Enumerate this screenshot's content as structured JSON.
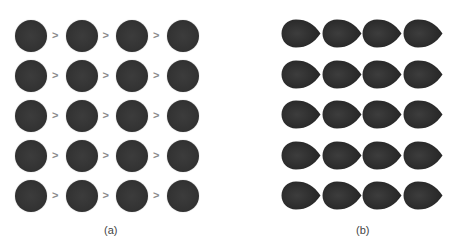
{
  "panels": [
    {
      "id": "a",
      "label": "(a)",
      "shape": "circle",
      "rows": 5,
      "cols": 4,
      "separator": ">",
      "fill_color": "#333333"
    },
    {
      "id": "b",
      "label": "(b)",
      "shape": "teardrop",
      "rows": 5,
      "cols": 4,
      "fill_color": "#333333"
    }
  ]
}
